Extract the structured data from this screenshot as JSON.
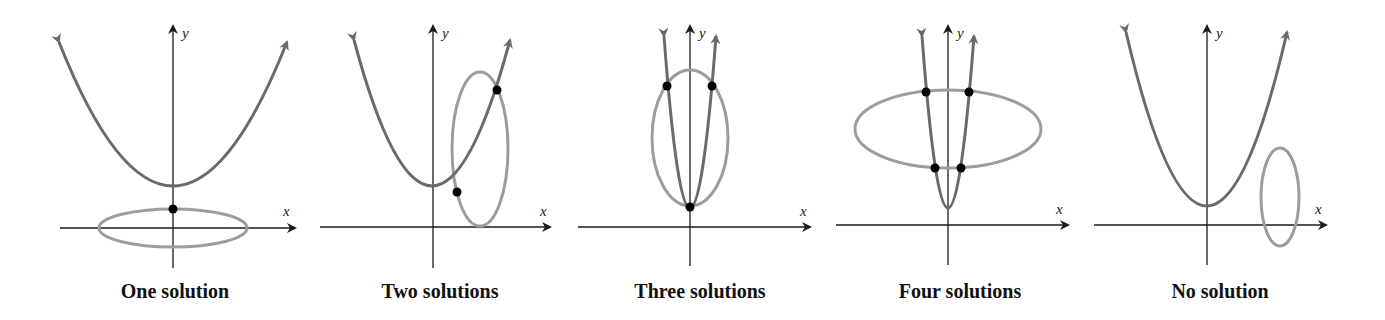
{
  "colors": {
    "parabola": "#6a6a6a",
    "ellipse": "#9c9c9c",
    "axis": "#1a1a1a",
    "point": "#000000"
  },
  "axes": {
    "x_label": "x",
    "y_label": "y"
  },
  "panels": [
    {
      "caption": "One solution",
      "solutions": 1
    },
    {
      "caption": "Two solutions",
      "solutions": 2
    },
    {
      "caption": "Three solutions",
      "solutions": 3
    },
    {
      "caption": "Four solutions",
      "solutions": 4
    },
    {
      "caption": "No solution",
      "solutions": 0
    }
  ]
}
